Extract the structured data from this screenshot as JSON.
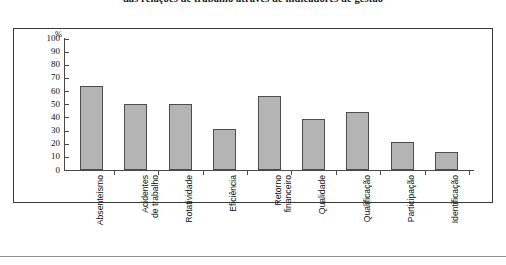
{
  "chart_data": {
    "type": "bar",
    "title": "das relações de trabalho através de indicadores de gestão",
    "subtitle": "",
    "xlabel": "",
    "ylabel": "%",
    "ylim": [
      0,
      100
    ],
    "ytick_labels": [
      "100",
      "90",
      "80",
      "70",
      "60",
      "50",
      "40",
      "30",
      "20",
      "10",
      "0"
    ],
    "ytick_values": [
      100,
      90,
      80,
      70,
      60,
      50,
      40,
      30,
      20,
      10,
      0
    ],
    "grid": false,
    "legend": "none",
    "categories": [
      "Absenteísmo",
      "Acidentes\nde trabalho",
      "Rotatividade",
      "Eficiência",
      "Retorno\nfinanceiro",
      "Qualidade",
      "Qualificação",
      "Participação",
      "Identificação"
    ],
    "values": [
      64,
      50,
      50,
      31,
      56,
      39,
      44,
      21,
      14
    ],
    "bar_fill_color": "#b4b4b4",
    "bar_border_color": "#4d4d4d",
    "axis_color": "#4a4a4a",
    "frame_color": "#3a3a3a",
    "text_color": "#111111"
  }
}
